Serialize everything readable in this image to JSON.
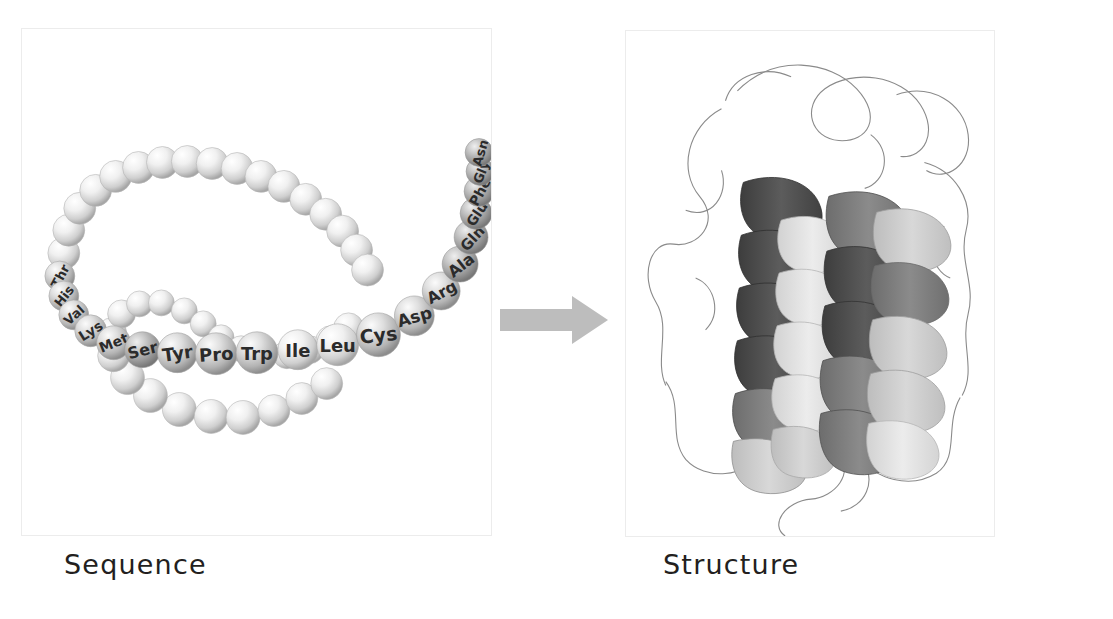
{
  "figure": {
    "background_color": "#ffffff",
    "panel_border_color": "#ececec"
  },
  "sequence_panel": {
    "caption": "Sequence",
    "description": "Beaded chain of amino acid residues",
    "bead_color_light": "#f2f2f2",
    "bead_color_dark": "#9a9a9a",
    "label_color": "#2b2b2b",
    "labeled_residues": [
      "Thr",
      "His",
      "Val",
      "Lys",
      "Met",
      "Ser",
      "Tyr",
      "Pro",
      "Trp",
      "Ile",
      "Leu",
      "Cys",
      "Asp",
      "Arg",
      "Ala",
      "Gln",
      "Glu",
      "Phe",
      "Gly",
      "Asn"
    ],
    "unlabeled_bead_count": 42
  },
  "arrow": {
    "direction": "right",
    "color": "#bdbdbd",
    "name": "transformation-arrow"
  },
  "structure_panel": {
    "caption": "Structure",
    "description": "Four-helix bundle ribbon diagram with loop backbone",
    "helix_colors": [
      "#4a4a4a",
      "#6e6e6e",
      "#9c9c9c",
      "#c8c8c8"
    ],
    "loop_color": "#8a8a8a",
    "helix_count": 4
  }
}
